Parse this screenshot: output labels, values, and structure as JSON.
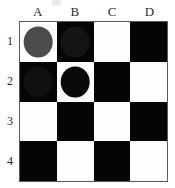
{
  "figure": {
    "top_artifact": "partial-clipped-glyph"
  },
  "board": {
    "columns": [
      "A",
      "B",
      "C",
      "D"
    ],
    "rows": [
      "1",
      "2",
      "3",
      "4"
    ],
    "border_color": "#5a5a5a",
    "light_color": "#fdfdfd",
    "dark_color": "#050505",
    "squares": [
      [
        {
          "id": "A1",
          "shade": "light",
          "piece": "gray"
        },
        {
          "id": "B1",
          "shade": "dark",
          "piece": "dim"
        },
        {
          "id": "C1",
          "shade": "light",
          "piece": null
        },
        {
          "id": "D1",
          "shade": "dark",
          "piece": null
        }
      ],
      [
        {
          "id": "A2",
          "shade": "dark",
          "piece": "dark"
        },
        {
          "id": "B2",
          "shade": "light",
          "piece": "black"
        },
        {
          "id": "C2",
          "shade": "dark",
          "piece": null
        },
        {
          "id": "D2",
          "shade": "light",
          "piece": null
        }
      ],
      [
        {
          "id": "A3",
          "shade": "light",
          "piece": null
        },
        {
          "id": "B3",
          "shade": "dark",
          "piece": null
        },
        {
          "id": "C3",
          "shade": "light",
          "piece": null
        },
        {
          "id": "D3",
          "shade": "dark",
          "piece": null
        }
      ],
      [
        {
          "id": "A4",
          "shade": "dark",
          "piece": null
        },
        {
          "id": "B4",
          "shade": "light",
          "piece": null
        },
        {
          "id": "C4",
          "shade": "dark",
          "piece": null
        },
        {
          "id": "D4",
          "shade": "light",
          "piece": null
        }
      ]
    ],
    "piece_colors": {
      "gray": "#4c4c4c",
      "dim": "#141414",
      "dark": "#101010",
      "black": "#0a0a0a"
    }
  }
}
